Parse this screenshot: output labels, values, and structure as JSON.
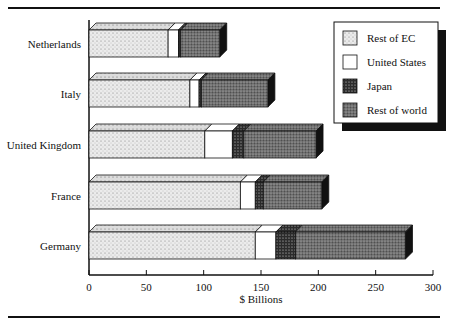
{
  "chart_data": {
    "type": "bar",
    "orientation": "horizontal",
    "stacked": true,
    "title": "",
    "xlabel": "$ Billions",
    "ylabel": "",
    "xlim": [
      0,
      300
    ],
    "xticks": [
      0,
      50,
      100,
      150,
      200,
      250,
      300
    ],
    "grid": false,
    "legend_position": "upper right",
    "categories": [
      "Netherlands",
      "Italy",
      "United Kingdom",
      "France",
      "Germany"
    ],
    "series": [
      {
        "name": "Rest of EC",
        "pattern": "light-stipple",
        "values": [
          69,
          88,
          101,
          132,
          145
        ]
      },
      {
        "name": "United States",
        "pattern": "white",
        "values": [
          9,
          8,
          24,
          13,
          18
        ]
      },
      {
        "name": "Japan",
        "pattern": "dark-dots",
        "values": [
          2,
          2,
          10,
          7,
          17
        ]
      },
      {
        "name": "Rest of world",
        "pattern": "medium-stipple",
        "values": [
          34,
          58,
          63,
          51,
          96
        ]
      }
    ]
  },
  "legend": {
    "items": [
      "Rest of EC",
      "United States",
      "Japan",
      "Rest of world"
    ]
  },
  "axis": {
    "x_title": "$ Billions",
    "tick_labels": [
      "0",
      "50",
      "100",
      "150",
      "200",
      "250",
      "300"
    ]
  }
}
